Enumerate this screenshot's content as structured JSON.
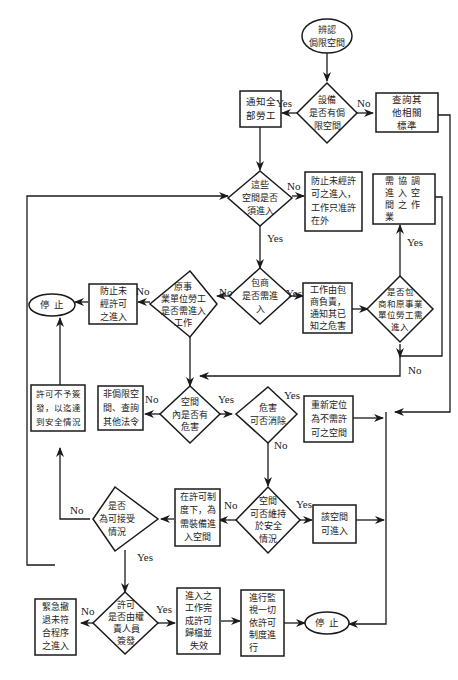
{
  "diagram": {
    "type": "flowchart",
    "colors": {
      "stroke": "#1a1a1a",
      "background": "#ffffff",
      "text": "#222222"
    },
    "nodes": {
      "start": {
        "shape": "ellipse",
        "text": "辨認\n侷限空間"
      },
      "d_equipment": {
        "shape": "diamond",
        "text": "設備\n是否有侷\n限空間"
      },
      "notify_workers": {
        "shape": "box",
        "text": "通知全\n部勞工"
      },
      "check_other": {
        "shape": "box",
        "text": "查詢其\n他相關\n標準"
      },
      "d_need_entry": {
        "shape": "diamond",
        "text": "這些\n空間是否\n須進入"
      },
      "prevent_unauth_outside": {
        "shape": "box",
        "text": "防止未經許\n可之進入，\n工作只准許\n在外"
      },
      "coordinate_entry": {
        "shape": "box",
        "text": "需協調\n進入空\n間之作\n業"
      },
      "d_contractor": {
        "shape": "diamond",
        "text": "包商\n是否需進\n入"
      },
      "d_host_employer": {
        "shape": "diamond",
        "text": "原事\n業單位勞工\n是否需進入\n工作"
      },
      "prevent_unauth": {
        "shape": "box",
        "text": "防止未\n經許可\n之進入"
      },
      "stop_top": {
        "shape": "ellipse",
        "text": "停  止"
      },
      "contractor_resp": {
        "shape": "box",
        "text": "工作由包\n商負責，\n通知其已\n知之危害"
      },
      "d_both": {
        "shape": "diamond",
        "text": "是否包\n商和原事業\n單位勞工需\n進入"
      },
      "permit_denied": {
        "shape": "box",
        "text": "許可不予簽\n發，以迄達\n到安全情況"
      },
      "non_confined": {
        "shape": "box",
        "text": "非侷限空\n間、查詢\n其他法令"
      },
      "d_hazard": {
        "shape": "diamond",
        "text": "空間\n內是否有\n危害"
      },
      "d_eliminate": {
        "shape": "diamond",
        "text": "危害\n可否消除"
      },
      "reclassify": {
        "shape": "box",
        "text": "重新定位\n為不需許\n可之空間"
      },
      "d_acceptable": {
        "shape": "diamond",
        "text": "是否\n為可接受\n情況"
      },
      "under_permit": {
        "shape": "box",
        "text": "在許可制\n度下，為\n需裝備進\n入空間"
      },
      "d_maintain": {
        "shape": "diamond",
        "text": "空間\n可否維持\n於安全\n情況"
      },
      "space_enterable": {
        "shape": "box",
        "text": "該空間\n可進入"
      },
      "emergency_evac": {
        "shape": "box",
        "text": "緊急撤\n退未符\n合程序\n之進入"
      },
      "d_permit_signed": {
        "shape": "diamond",
        "text": "許可\n是否由權\n責人員\n簽發"
      },
      "work_complete": {
        "shape": "box",
        "text": "進入之\n工作完\n成許可\n歸檔並\n失效"
      },
      "monitor": {
        "shape": "box",
        "text": "進行監\n視一切\n依許可\n制度進\n行"
      },
      "stop_bottom": {
        "shape": "ellipse",
        "text": "停  止"
      }
    },
    "edge_labels": {
      "equipment_yes": "Yes",
      "equipment_no": "No",
      "need_entry_no": "No",
      "need_entry_yes": "Yes",
      "contractor_yes": "Yes",
      "contractor_no": "No",
      "host_no": "No",
      "both_yes": "Yes",
      "both_no": "No",
      "hazard_no": "No",
      "hazard_yes": "Yes",
      "eliminate_yes": "Yes",
      "eliminate_no": "No",
      "maintain_no": "No",
      "maintain_yes": "Yes",
      "acceptable_no": "No",
      "acceptable_yes": "Yes",
      "permit_no": "No",
      "permit_yes": "Yes"
    }
  }
}
